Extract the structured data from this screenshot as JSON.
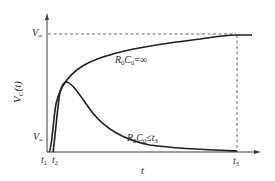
{
  "diagram": {
    "type": "voltage-time curves",
    "y_axis": {
      "label": "V_C(t)",
      "label_main": "V",
      "label_sub": "C",
      "label_tail": "(t)",
      "ticks": [
        {
          "main": "V",
          "sub": "∞",
          "position": "top"
        },
        {
          "main": "V",
          "sub": "=",
          "position": "bottom"
        }
      ]
    },
    "x_axis": {
      "label": "t",
      "ticks": [
        {
          "main": "t",
          "sub": "1"
        },
        {
          "main": "t",
          "sub": "2"
        },
        {
          "main": "t",
          "sub": "3"
        }
      ]
    },
    "curves": [
      {
        "name": "upper",
        "label_main": "R",
        "label_sub1": "0",
        "label_mid": "C",
        "label_sub2": "0",
        "label_tail": "=∞",
        "label": "R0C0=∞"
      },
      {
        "name": "lower",
        "label_main": "R",
        "label_sub1": "0",
        "label_mid": "C",
        "label_sub2": "0",
        "label_tail": "≤t",
        "label_sub3": "3",
        "label": "R0C0≤t3"
      }
    ],
    "colors": {
      "axis": "#3a3a3a",
      "curve": "#1e1e1e",
      "dashed": "#555555",
      "text": "#2a2a2a",
      "background": "#ffffff"
    }
  }
}
